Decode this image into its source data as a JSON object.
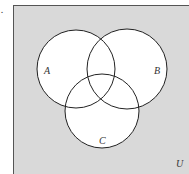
{
  "diagram": {
    "type": "venn",
    "marker": ".",
    "universe": {
      "label": "U",
      "fill": "#d9d9d9",
      "stroke": "#555555"
    },
    "sets": [
      {
        "label": "A",
        "cx": 76,
        "cy": 69,
        "r": 39,
        "label_x": 44,
        "label_y": 74
      },
      {
        "label": "B",
        "cx": 127,
        "cy": 69,
        "r": 40,
        "label_x": 155,
        "label_y": 74
      },
      {
        "label": "C",
        "cx": 102,
        "cy": 111,
        "r": 37,
        "label_x": 100,
        "label_y": 144
      }
    ],
    "circle_fill": "#ffffff",
    "circle_stroke": "#222222"
  }
}
